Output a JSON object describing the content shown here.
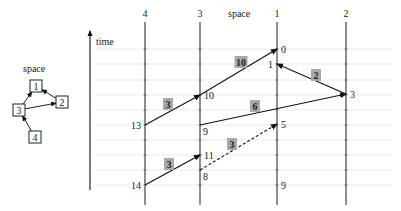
{
  "topology": {
    "title": "space",
    "nodes": [
      {
        "id": "1",
        "x": 36,
        "y": 86
      },
      {
        "id": "2",
        "x": 62,
        "y": 102
      },
      {
        "id": "3",
        "x": 19,
        "y": 110
      },
      {
        "id": "4",
        "x": 35,
        "y": 137
      }
    ],
    "edges": [
      {
        "from": "3",
        "to": "1"
      },
      {
        "from": "2",
        "to": "1"
      },
      {
        "from": "3",
        "to": "2"
      },
      {
        "from": "4",
        "to": "3"
      }
    ]
  },
  "spacetime": {
    "space_label": "space",
    "time_label": "time",
    "processes": [
      {
        "id": "4",
        "x": 145
      },
      {
        "id": "3",
        "x": 200
      },
      {
        "id": "1",
        "x": 277
      },
      {
        "id": "2",
        "x": 346
      }
    ],
    "gridlines_y": [
      49,
      64,
      80,
      95,
      110,
      125,
      140,
      155,
      170,
      185
    ],
    "events": [
      {
        "label": "0",
        "x": 277,
        "y": 49,
        "side": "right"
      },
      {
        "label": "1",
        "x": 277,
        "y": 64,
        "side": "left"
      },
      {
        "label": "3",
        "x": 346,
        "y": 94,
        "side": "right"
      },
      {
        "label": "10",
        "x": 200,
        "y": 95,
        "side": "right"
      },
      {
        "label": "13",
        "x": 145,
        "y": 125,
        "side": "left"
      },
      {
        "label": "9",
        "x": 200,
        "y": 125,
        "side": "right-below"
      },
      {
        "label": "5",
        "x": 277,
        "y": 124,
        "side": "right"
      },
      {
        "label": "11",
        "x": 200,
        "y": 155,
        "side": "right"
      },
      {
        "label": "8",
        "x": 200,
        "y": 170,
        "side": "right-below"
      },
      {
        "label": "14",
        "x": 145,
        "y": 185,
        "side": "left"
      },
      {
        "label": "9",
        "x": 277,
        "y": 185,
        "side": "right"
      }
    ],
    "messages": [
      {
        "from": [
          145,
          125
        ],
        "to": [
          200,
          95
        ],
        "weight": "3",
        "dashed": false
      },
      {
        "from": [
          200,
          95
        ],
        "to": [
          277,
          49
        ],
        "weight": "10",
        "dashed": false
      },
      {
        "from": [
          346,
          94
        ],
        "to": [
          277,
          64
        ],
        "weight": "2",
        "dashed": false
      },
      {
        "from": [
          200,
          125
        ],
        "to": [
          346,
          94
        ],
        "weight": "6",
        "dashed": false
      },
      {
        "from": [
          145,
          185
        ],
        "to": [
          200,
          155
        ],
        "weight": "3",
        "dashed": false
      },
      {
        "from": [
          200,
          170
        ],
        "to": [
          277,
          124
        ],
        "weight": "3",
        "dashed": true
      }
    ],
    "weight_boxes": [
      {
        "text": "3",
        "x": 168,
        "y": 104
      },
      {
        "text": "10",
        "x": 241,
        "y": 62
      },
      {
        "text": "2",
        "x": 316,
        "y": 75
      },
      {
        "text": "6",
        "x": 255,
        "y": 106
      },
      {
        "text": "3",
        "x": 169,
        "y": 164
      },
      {
        "text": "3",
        "x": 232,
        "y": 144
      }
    ]
  },
  "colors": {
    "line": "#222222",
    "grid": "#e6e6e6",
    "weight_box": "#a9a9a9"
  }
}
